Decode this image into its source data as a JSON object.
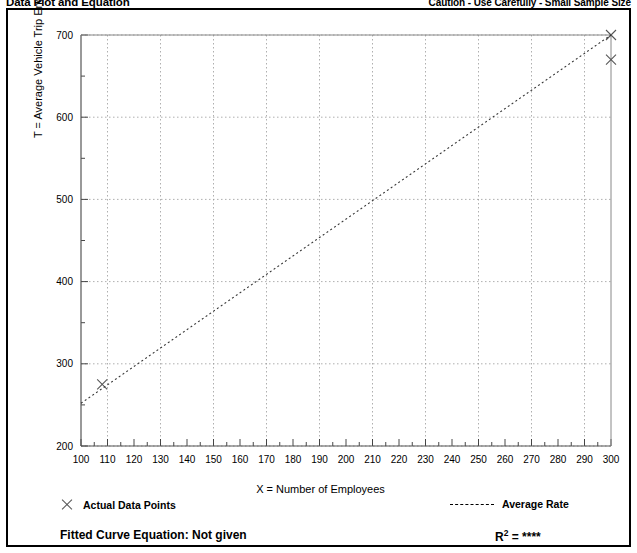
{
  "header": {
    "title": "Data Plot and Equation",
    "caution": "Caution - Use Carefully - Small Sample Size"
  },
  "legend": {
    "points_label": "Actual Data Points",
    "rate_label": "Average Rate",
    "points_marker": "x-marker-icon",
    "rate_marker": "dashed-line-icon"
  },
  "equation": {
    "fitted_label": "Fitted Curve Equation:  Not given",
    "r_squared_prefix": "R",
    "r_squared_exponent": "2",
    "r_squared_value": "= ****"
  },
  "chart_data": {
    "type": "scatter",
    "title": "Data Plot and Equation",
    "xlabel": "X = Number of Employees",
    "ylabel": "T = Average Vehicle Trip Ends",
    "xlim": [
      100,
      300
    ],
    "ylim": [
      200,
      700
    ],
    "xticks": [
      100,
      110,
      120,
      130,
      140,
      150,
      160,
      170,
      180,
      190,
      200,
      210,
      220,
      230,
      240,
      250,
      260,
      270,
      280,
      290,
      300
    ],
    "yticks": [
      200,
      300,
      400,
      500,
      600,
      700
    ],
    "x_minor_step": 5,
    "y_minor_step": 50,
    "grid": true,
    "grid_style": "dotted",
    "legend_position": "below-axes",
    "series": [
      {
        "name": "Actual Data Points",
        "type": "scatter",
        "marker": "x",
        "color": "#555555",
        "points": [
          {
            "x": 108,
            "y": 275
          },
          {
            "x": 300,
            "y": 700
          },
          {
            "x": 300,
            "y": 670
          }
        ]
      },
      {
        "name": "Average Rate",
        "type": "line",
        "style": "dashed",
        "color": "#333333",
        "x": [
          100,
          300
        ],
        "y": [
          252,
          700
        ]
      }
    ]
  }
}
